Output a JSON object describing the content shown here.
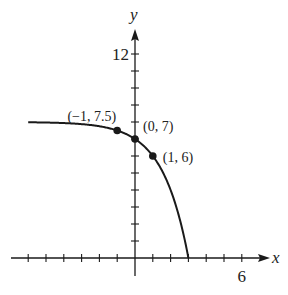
{
  "chart_data": {
    "type": "line",
    "title": "",
    "xlabel": "x",
    "ylabel": "y",
    "function": "y = 8 - 2^x",
    "xlim": [
      -6,
      7
    ],
    "ylim": [
      -1,
      14
    ],
    "x_ticks": [
      -6,
      -5,
      -4,
      -3,
      -2,
      -1,
      1,
      2,
      3,
      4,
      5,
      6
    ],
    "y_ticks": [
      1,
      2,
      3,
      4,
      5,
      6,
      7,
      8,
      9,
      10,
      11,
      12
    ],
    "x_tick_labels": [
      {
        "value": 6,
        "label": "6"
      }
    ],
    "y_tick_labels": [
      {
        "value": 12,
        "label": "12"
      }
    ],
    "grid": false,
    "series": [
      {
        "name": "curve",
        "x": [
          -6,
          -5,
          -4,
          -3,
          -2,
          -1,
          0,
          1,
          2,
          2.5,
          3
        ],
        "values": [
          7.98,
          7.97,
          7.94,
          7.88,
          7.75,
          7.5,
          7,
          6,
          4,
          2.34,
          0
        ]
      }
    ],
    "points": [
      {
        "x": -1,
        "y": 7.5,
        "label": "(−1, 7.5)"
      },
      {
        "x": 0,
        "y": 7,
        "label": "(0, 7)"
      },
      {
        "x": 1,
        "y": 6,
        "label": "(1, 6)"
      }
    ]
  },
  "colors": {
    "ink": "#1a1a1a",
    "background": "#ffffff"
  }
}
